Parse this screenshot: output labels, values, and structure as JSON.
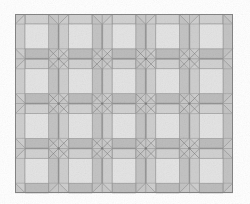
{
  "image": {
    "title": "Square paver tile pattern swatch",
    "description": "Grayscale seamless texture of square pavers with beveled mitered frames arranged in a regular grid",
    "width": 250,
    "height": 204,
    "background_color": "#ffffff"
  },
  "pattern": {
    "kind": "tiled-paver-texture",
    "columns": 5,
    "rows": 4,
    "origin_x": 15,
    "origin_y": 14,
    "cell_width": 43.6,
    "cell_height": 44.8,
    "bevel_inset": 9.5,
    "joint_width": 1.0,
    "outer_border_color": "#8a8a8a",
    "outer_border_width": 1
  },
  "colors": {
    "tile_face": "#e4e4e4",
    "bevel_top": "#d2d2d2",
    "bevel_left": "#cfcfcf",
    "bevel_right": "#c4c4c4",
    "bevel_bottom": "#bdbdbd",
    "joint_fill": "#c9c9c9",
    "joint_line": "#9a9a9a",
    "edge_line": "#858585",
    "shadow_line": "#7c7c7c",
    "grain_dark": "#9d9d9d",
    "grain_light": "#f2f2f2"
  },
  "legend": {
    "note": "no text labels present in image"
  }
}
